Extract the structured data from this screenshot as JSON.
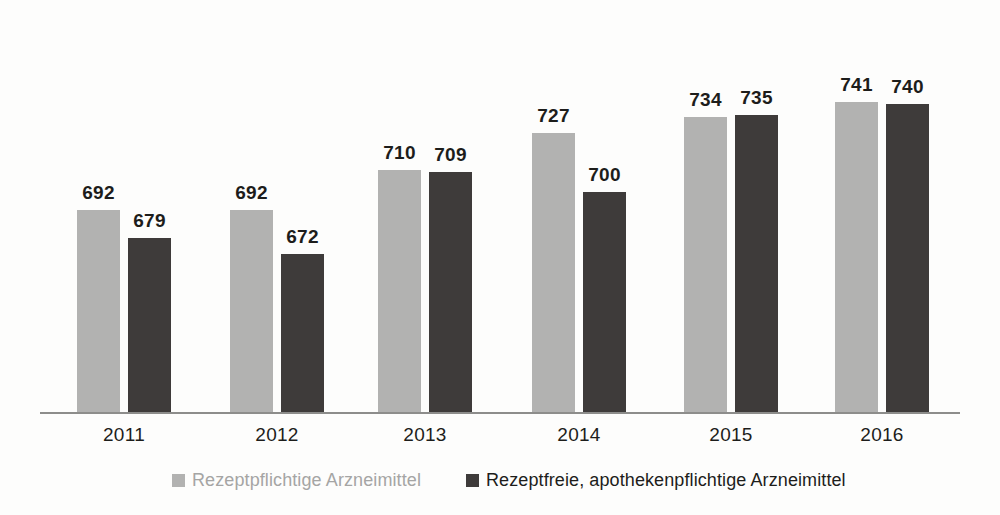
{
  "chart_data": {
    "type": "bar",
    "title": "",
    "subtitle": "",
    "xlabel": "",
    "ylabel": "",
    "categories": [
      "2011",
      "2012",
      "2013",
      "2014",
      "2015",
      "2016"
    ],
    "series": [
      {
        "name": "Rezeptpflichtige Arzneimittel",
        "color": "#b2b2b1",
        "values": [
          692,
          692,
          710,
          727,
          734,
          741
        ]
      },
      {
        "name": "Rezeptfreie, apothekenpflichtige Arzneimittel",
        "color": "#3e3b3a",
        "values": [
          679,
          672,
          709,
          700,
          735,
          740
        ]
      }
    ],
    "data_labels": true,
    "grid": false,
    "ylim": [
      600,
      760
    ],
    "axis_visible": {
      "x": true,
      "y": false
    },
    "legend": {
      "position": "bottom",
      "entries": [
        {
          "label": "Rezeptpflichtige Arzneimittel",
          "color": "#b2b2b1",
          "marker": "square-swatch"
        },
        {
          "label": "Rezeptfreie, apothekenpflichtige Arzneimittel",
          "color": "#3e3b3a",
          "marker": "square-swatch"
        }
      ]
    }
  },
  "legend": {
    "items": [
      {
        "label": "Rezeptpflichtige Arzneimittel"
      },
      {
        "label": "Rezeptfreie, apothekenpflichtige Arzneimittel"
      }
    ]
  }
}
